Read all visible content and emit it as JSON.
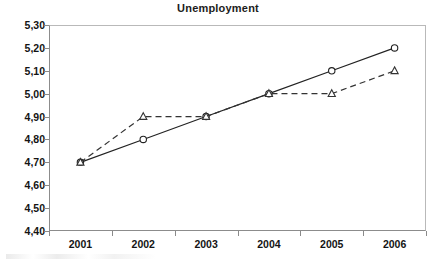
{
  "chart_data": {
    "type": "line",
    "title": "Unemployment",
    "xlabel": "",
    "ylabel": "",
    "categories": [
      "2001",
      "2002",
      "2003",
      "2004",
      "2005",
      "2006"
    ],
    "series": [
      {
        "name": "series-solid-circle",
        "values": [
          4.7,
          4.8,
          4.9,
          5.0,
          5.1,
          5.2
        ],
        "line_style": "solid",
        "marker": "circle",
        "color": "#222222"
      },
      {
        "name": "series-dashed-triangle",
        "values": [
          4.7,
          4.9,
          4.9,
          5.0,
          5.0,
          5.1
        ],
        "line_style": "dashed",
        "marker": "triangle",
        "color": "#333333"
      }
    ],
    "ylim": [
      4.4,
      5.3
    ],
    "ytick_values": [
      5.3,
      5.2,
      5.1,
      5.0,
      4.9,
      4.8,
      4.7,
      4.6,
      4.5,
      4.4
    ],
    "ytick_labels": [
      "5,30",
      "5,20",
      "5,10",
      "5,00",
      "4,90",
      "4,80",
      "4,70",
      "4,60",
      "4,50",
      "4,40"
    ],
    "xtick_labels": [
      "2001",
      "2002",
      "2003",
      "2004",
      "2005",
      "2006"
    ],
    "grid": false,
    "legend": "none",
    "decimal_separator": ","
  },
  "colors": {
    "axis": "#8a8a8a",
    "frame_light": "#b9b9b9",
    "text": "#141414",
    "plot_background": "#ffffff"
  }
}
